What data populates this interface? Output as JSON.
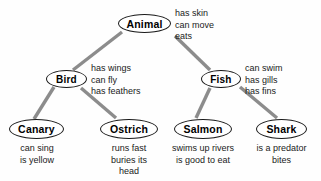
{
  "diagram": {
    "type": "hierarchical-semantic-network",
    "edge_color": "#8c8c8c",
    "node_border_color": "#1a1a1a",
    "text_color": "#1a1a1a",
    "background_color": "#fefefe"
  },
  "nodes": [
    {
      "id": "animal",
      "label": "Animal",
      "x": 118,
      "y": 14,
      "w": 53,
      "h": 19,
      "font_size": 10.5,
      "properties": [
        "has skin",
        "can move",
        "eats"
      ],
      "prop_x": 175,
      "prop_y": 8,
      "prop_align": "left"
    },
    {
      "id": "bird",
      "label": "Bird",
      "x": 46,
      "y": 70,
      "w": 41,
      "h": 18,
      "font_size": 10,
      "properties": [
        "has wings",
        "can fly",
        "has feathers"
      ],
      "prop_x": 91,
      "prop_y": 63,
      "prop_align": "left"
    },
    {
      "id": "fish",
      "label": "Fish",
      "x": 201,
      "y": 70,
      "w": 40,
      "h": 18,
      "font_size": 10,
      "properties": [
        "can swim",
        "has gills",
        "has fins"
      ],
      "prop_x": 245,
      "prop_y": 63,
      "prop_align": "left"
    },
    {
      "id": "canary",
      "label": "Canary",
      "x": 9,
      "y": 119,
      "w": 55,
      "h": 20,
      "font_size": 10.5,
      "properties": [
        "can sing",
        "is yellow"
      ],
      "prop_x": 11,
      "prop_y": 143,
      "prop_align": "center",
      "prop_w": 52
    },
    {
      "id": "ostrich",
      "label": "Ostrich",
      "x": 100,
      "y": 119,
      "w": 58,
      "h": 20,
      "font_size": 10.5,
      "properties": [
        "runs fast",
        "buries its",
        "head"
      ],
      "prop_x": 102,
      "prop_y": 143,
      "prop_align": "center",
      "prop_w": 54
    },
    {
      "id": "salmon",
      "label": "Salmon",
      "x": 174,
      "y": 119,
      "w": 58,
      "h": 20,
      "font_size": 10.5,
      "properties": [
        "swims up rivers",
        "is good to eat"
      ],
      "prop_x": 162,
      "prop_y": 143,
      "prop_align": "center",
      "prop_w": 82
    },
    {
      "id": "shark",
      "label": "Shark",
      "x": 256,
      "y": 119,
      "w": 51,
      "h": 20,
      "font_size": 10.5,
      "properties": [
        "is a predator",
        "bites"
      ],
      "prop_x": 248,
      "prop_y": 143,
      "prop_align": "center",
      "prop_w": 67
    }
  ],
  "edges": [
    {
      "from": "animal",
      "to": "bird",
      "x1": 122,
      "y1": 32,
      "x2": 73,
      "y2": 70
    },
    {
      "from": "animal",
      "to": "fish",
      "x1": 175,
      "y1": 36,
      "x2": 210,
      "y2": 70
    },
    {
      "from": "bird",
      "to": "canary",
      "x1": 54,
      "y1": 87,
      "x2": 34,
      "y2": 119
    },
    {
      "from": "bird",
      "to": "ostrich",
      "x1": 81,
      "y1": 88,
      "x2": 116,
      "y2": 118
    },
    {
      "from": "fish",
      "to": "salmon",
      "x1": 210,
      "y1": 88,
      "x2": 196,
      "y2": 118
    },
    {
      "from": "fish",
      "to": "shark",
      "x1": 240,
      "y1": 87,
      "x2": 277,
      "y2": 118
    }
  ]
}
